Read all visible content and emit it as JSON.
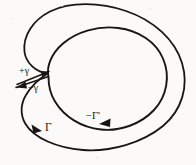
{
  "figure": {
    "kind": "contour-integration-diagram",
    "background_color": "#fbfaf8",
    "ink_color": "#191512",
    "width": 196,
    "height": 165
  },
  "labels": {
    "plus_gamma": "+γ",
    "minus_gamma": "−γ",
    "minus_gamma_prime": "−Γ'",
    "big_gamma": "Γ"
  },
  "curves": {
    "outer": {
      "name": "Γ",
      "role": "outer-contour",
      "direction": "counterclockwise-as-drawn",
      "path": "M 47.5 73.5 C 36 72 26 63 24.5 52 C 22.5 36 33 20 50 11.5 C 70 1.5 100 2 126 11 C 154 20.5 175 40 182 63 C 189 86 182 110 163 126 C 142 143 111 152 83 150 C 57 148 34 138 25.5 124 C 20 115 20.5 104 26 95 C 31 86.5 39 79 47.5 73.5 Z"
    },
    "inner": {
      "name": "−Γ'",
      "role": "inner-contour",
      "direction": "clockwise-as-drawn",
      "path": "M 48.5 77 C 46 66 52 53 63 43.5 C 77 31.5 98 25.5 118 28 C 139 30.5 156 42 163 58.5 C 170.5 76 167 96 154 110 C 141 124 120 131.5 101 129.5 C 81 127.5 64 116.5 55 101.5 C 50 93.5 48.5 85 48.5 77 Z"
    },
    "slit": {
      "name": "γ",
      "role": "connecting-cut",
      "outgoing_path": "M 17 84.5 L 49 71.5",
      "returning_path": "M 48.5 76.5 L 16 87.5"
    }
  },
  "arrows": [
    {
      "name": "plus-gamma-arrow",
      "on": "slit-outgoing",
      "direction": "up-right",
      "points": "49 71.5 40.5 71 42.5 77.5"
    },
    {
      "name": "minus-gamma-arrow",
      "on": "slit-returning",
      "direction": "down-left",
      "points": "16.5 87.5 25.5 81.5 27 88.5"
    },
    {
      "name": "minus-gamma-prime-arrow",
      "on": "inner-contour",
      "direction": "left",
      "points": "99 124 110.5 118.5 110 127"
    },
    {
      "name": "big-gamma-arrow",
      "on": "outer-contour",
      "direction": "down-right",
      "points": "42 131 31.5 124.5 33.5 133.5"
    }
  ],
  "specks": [
    {
      "left": 150,
      "top": 8,
      "size": 1
    },
    {
      "left": 172,
      "top": 118,
      "size": 1
    },
    {
      "left": 12,
      "top": 18,
      "size": 1
    },
    {
      "left": 96,
      "top": 157,
      "size": 1
    },
    {
      "left": 62,
      "top": 6,
      "size": 1
    }
  ]
}
